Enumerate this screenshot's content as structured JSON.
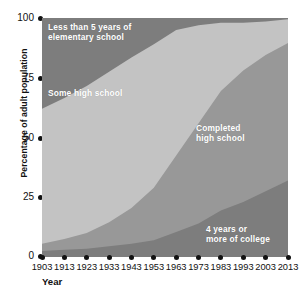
{
  "chart_data": {
    "type": "area",
    "stacked": true,
    "title": "",
    "xlabel": "Year",
    "ylabel": "Percentage of adult population",
    "ylim": [
      0,
      100
    ],
    "yticks": [
      0,
      25,
      50,
      75,
      100
    ],
    "ytick_labels": [
      "0",
      "25",
      "50",
      "75",
      "100"
    ],
    "xlim": [
      1903,
      2013
    ],
    "grid": false,
    "legend_position": "inline-annotations",
    "x": [
      1903,
      1913,
      1923,
      1933,
      1943,
      1953,
      1963,
      1973,
      1983,
      1993,
      2003,
      2013
    ],
    "xtick_labels": [
      "1903",
      "1913",
      "1923",
      "1933",
      "1943",
      "1953",
      "1963",
      "1973",
      "1983",
      "1993",
      "2003",
      "2013"
    ],
    "series": [
      {
        "name": "4 years or more of college",
        "label": "4 years or\nmore of college",
        "color": "#7d7d7d",
        "order": 1,
        "values": [
          2.5,
          3.0,
          3.5,
          4.5,
          5.5,
          7.0,
          10.5,
          14.0,
          19.5,
          23.0,
          27.5,
          32.0
        ]
      },
      {
        "name": "Completed high school",
        "label": "Completed\nhigh school",
        "color": "#989898",
        "order": 2,
        "values": [
          3.0,
          4.5,
          6.5,
          10.0,
          15.0,
          22.0,
          32.0,
          42.0,
          50.0,
          55.0,
          57.0,
          57.5
        ]
      },
      {
        "name": "Some high school",
        "label": "Some high school",
        "color": "#c3c3c3",
        "order": 3,
        "values": [
          56.5,
          59.0,
          61.5,
          63.0,
          63.0,
          60.0,
          52.5,
          41.0,
          28.5,
          20.0,
          14.0,
          10.0
        ]
      },
      {
        "name": "Less than 5 years of elementary school",
        "label": "Less than 5 years of\nelementary school",
        "color": "#7d7d7d",
        "order": 4,
        "values": [
          38.0,
          33.5,
          28.5,
          22.5,
          16.5,
          11.0,
          5.0,
          3.0,
          2.0,
          2.0,
          1.5,
          0.5
        ]
      }
    ],
    "cumulative_boundaries_percent": {
      "college_top": [
        2.5,
        3.0,
        3.5,
        4.5,
        5.5,
        7.0,
        10.5,
        14.0,
        19.5,
        23.0,
        27.5,
        32.0
      ],
      "completed_hs_top": [
        5.5,
        7.5,
        10.0,
        14.5,
        20.5,
        29.0,
        42.5,
        56.0,
        69.5,
        78.0,
        85.0,
        89.5
      ],
      "some_hs_top": [
        62.0,
        66.5,
        71.5,
        77.5,
        83.5,
        89.0,
        95.0,
        97.0,
        98.0,
        98.0,
        98.5,
        99.5
      ]
    }
  },
  "axes": {
    "y_title": "Percentage of adult population",
    "x_title": "Year",
    "y_ticks": [
      "100",
      "75",
      "50",
      "25",
      "0"
    ],
    "x_ticks": [
      "1903",
      "1913",
      "1923",
      "1933",
      "1943",
      "1953",
      "1963",
      "1973",
      "1983",
      "1993",
      "2003",
      "2013"
    ]
  },
  "annotations": {
    "elementary": "Less than 5 years of\nelementary school",
    "some_high_school": "Some high school",
    "completed_high_school": "Completed\nhigh school",
    "college": "4 years or\nmore of college"
  },
  "colors": {
    "band_dark": "#7d7d7d",
    "band_medium": "#989898",
    "band_light": "#c3c3c3",
    "text": "#111111",
    "label_text": "#ffffff",
    "background": "#ffffff"
  }
}
